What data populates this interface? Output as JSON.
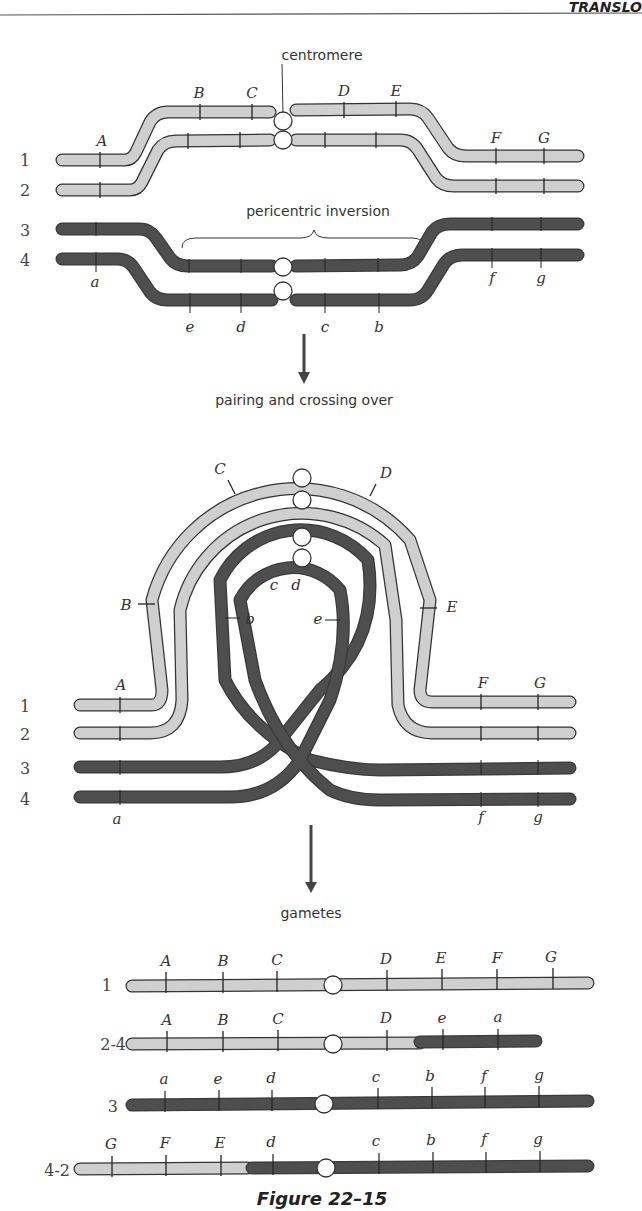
{
  "header": {
    "running_head": "TRANSLO"
  },
  "panel_top": {
    "centromere_label": "centromere",
    "inversion_label": "pericentric inversion",
    "chromatid_numbers": [
      "1",
      "2",
      "3",
      "4"
    ],
    "normal_labels": [
      "A",
      "B",
      "C",
      "D",
      "E",
      "F",
      "G"
    ],
    "inverted_labels_bottom": [
      "a",
      "e",
      "d",
      "c",
      "b",
      "f",
      "g"
    ]
  },
  "arrow1": {
    "label": "pairing and crossing over"
  },
  "panel_middle": {
    "chromatid_numbers": [
      "1",
      "2",
      "3",
      "4"
    ],
    "loop_labels_upper": [
      "C",
      "D"
    ],
    "loop_labels_side": [
      "B",
      "E"
    ],
    "loop_labels_inner": [
      "c",
      "d",
      "b",
      "e"
    ],
    "end_labels_top": [
      "A",
      "F",
      "G"
    ],
    "end_labels_bottom": [
      "a",
      "f",
      "g"
    ]
  },
  "arrow2": {
    "label": "gametes"
  },
  "gametes": [
    {
      "id": "1",
      "labels": [
        "A",
        "B",
        "C",
        "D",
        "E",
        "F",
        "G"
      ]
    },
    {
      "id": "2-4",
      "labels": [
        "A",
        "B",
        "C",
        "D",
        "e",
        "a"
      ]
    },
    {
      "id": "3",
      "labels": [
        "a",
        "e",
        "d",
        "c",
        "b",
        "f",
        "g"
      ]
    },
    {
      "id": "4-2",
      "labels": [
        "G",
        "F",
        "E",
        "d",
        "c",
        "b",
        "f",
        "g"
      ]
    }
  ],
  "caption": {
    "figure_title": "Figure 22–15"
  },
  "colors": {
    "light_chromatid": "#cfcfcf",
    "dark_chromatid": "#4a4a4a",
    "outline": "#333333",
    "centromere": "#ffffff"
  }
}
